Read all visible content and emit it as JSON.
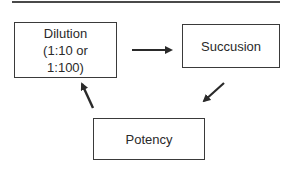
{
  "diagram": {
    "type": "cycle",
    "nodes": [
      {
        "id": "dilution",
        "label": "Dilution\n(1:10 or\n1:100)"
      },
      {
        "id": "succusion",
        "label": "Succusion"
      },
      {
        "id": "potency",
        "label": "Potency"
      }
    ],
    "edges": [
      {
        "from": "dilution",
        "to": "succusion"
      },
      {
        "from": "succusion",
        "to": "potency"
      },
      {
        "from": "potency",
        "to": "dilution"
      }
    ],
    "colors": {
      "stroke": "#2a2a2a",
      "background": "#ffffff"
    }
  }
}
